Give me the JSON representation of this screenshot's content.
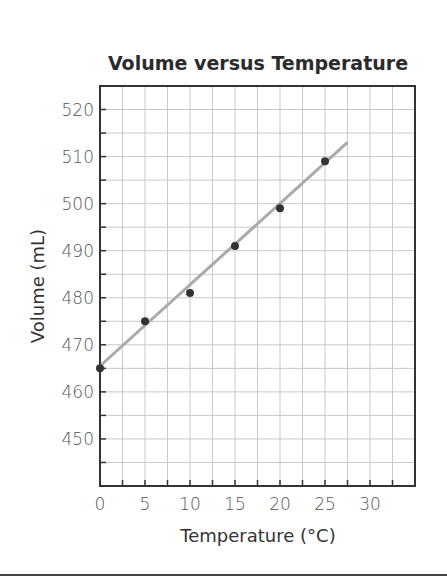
{
  "chart_data": {
    "type": "scatter",
    "title": "Volume versus Temperature",
    "xlabel": "Temperature (°C)",
    "ylabel": "Volume (mL)",
    "xlim": [
      0,
      35
    ],
    "ylim": [
      440,
      525
    ],
    "x_ticks": [
      0,
      5,
      10,
      15,
      20,
      25,
      30
    ],
    "y_ticks": [
      450,
      460,
      470,
      480,
      490,
      500,
      510,
      520
    ],
    "grid": true,
    "grid_x_step": 2.5,
    "grid_y_step": 5,
    "series": [
      {
        "name": "Measured volume",
        "x": [
          0,
          5,
          10,
          15,
          20,
          25
        ],
        "y": [
          465,
          475,
          481,
          491,
          499,
          509
        ],
        "marker_color": "#333333"
      }
    ],
    "trendline": {
      "name": "Best-fit line",
      "x": [
        0,
        27.5
      ],
      "y": [
        465.5,
        513
      ],
      "color": "#aaaaaa"
    }
  },
  "colors": {
    "frame": "#333333",
    "grid": "#c8c8c8",
    "points": "#333333",
    "line": "#aaaaaa",
    "rule": "#444444"
  }
}
